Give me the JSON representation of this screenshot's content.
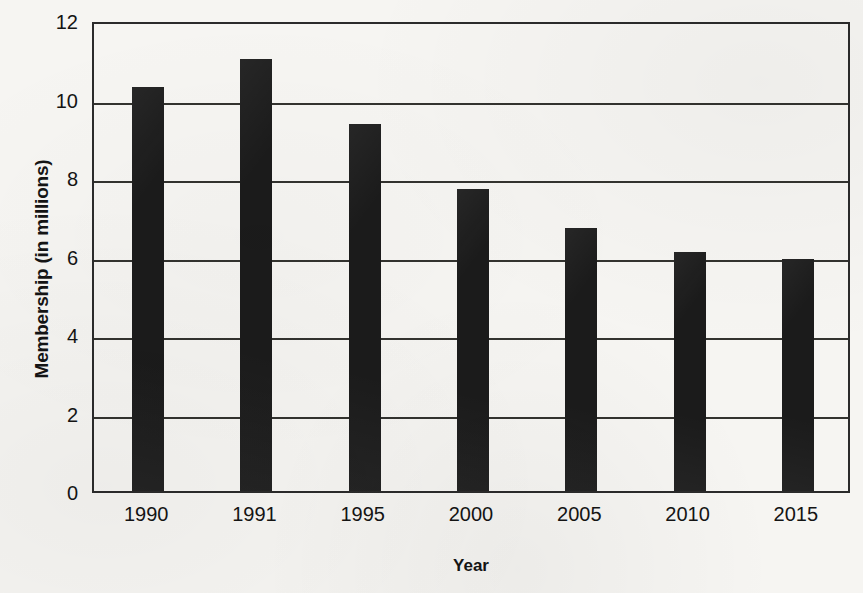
{
  "chart_data": {
    "type": "bar",
    "title": "",
    "subtitle": "",
    "xlabel": "Year",
    "ylabel": "Membership (in millions)",
    "categories": [
      "1990",
      "1991",
      "1995",
      "2000",
      "2005",
      "2010",
      "2015"
    ],
    "values": [
      10.3,
      11.0,
      9.35,
      7.7,
      6.7,
      6.1,
      5.9
    ],
    "series": [
      {
        "name": "Membership",
        "values": [
          10.3,
          11.0,
          9.35,
          7.7,
          6.7,
          6.1,
          5.9
        ]
      }
    ],
    "ylim": [
      0,
      12
    ],
    "xlim_categories": 7,
    "y_ticks": [
      0,
      2,
      4,
      6,
      8,
      10,
      12
    ],
    "y_tick_labels": [
      "0",
      "2",
      "4",
      "6",
      "8",
      "10",
      "12"
    ],
    "grid": "horizontal",
    "legend": "none",
    "annotations": [],
    "bar_color": "#1b1b1b",
    "gridline_color": "#33332f",
    "axis_color": "#2b2b2b",
    "background_color": "#f6f5f2",
    "text_color": "#141414"
  }
}
